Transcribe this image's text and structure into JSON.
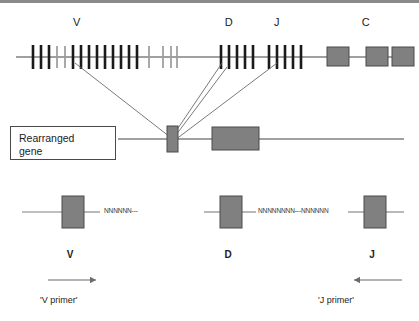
{
  "figure": {
    "colors": {
      "line": "#808080",
      "segment_dark": "#1a1a1a",
      "segment_light": "#9a9a9a",
      "box_fill": "#808080",
      "box_stroke": "#4a4a4a",
      "connector": "#6b6b6b",
      "text": "#222222",
      "top_rule": "#8a8a8a"
    }
  },
  "germline": {
    "labels": [
      {
        "text": "V",
        "x": 77,
        "y": 17
      },
      {
        "text": "D",
        "x": 229,
        "y": 17
      },
      {
        "text": "J",
        "x": 277,
        "y": 17
      },
      {
        "text": "C",
        "x": 366,
        "y": 17
      }
    ],
    "axis": {
      "x1": 16,
      "x2": 412,
      "y": 57
    },
    "v_cluster_dark": [
      33,
      41,
      49,
      73,
      81,
      89,
      97,
      105,
      113,
      121,
      129,
      137
    ],
    "v_cluster_light": [
      57,
      65,
      149,
      163,
      171,
      177
    ],
    "d_cluster": [
      221,
      229,
      237,
      245,
      253
    ],
    "j_cluster": [
      269,
      277,
      285,
      293,
      301
    ],
    "c_boxes": [
      {
        "x": 327,
        "y": 47,
        "w": 22,
        "h": 19
      },
      {
        "x": 366,
        "y": 47,
        "w": 22,
        "h": 19
      },
      {
        "x": 392,
        "y": 47,
        "w": 22,
        "h": 19
      }
    ]
  },
  "rearranged": {
    "caption": "Rearranged\ngene",
    "axis": {
      "x1": 118,
      "x2": 404,
      "y": 139
    },
    "v_segment_box": {
      "x": 167,
      "y": 126,
      "w": 11,
      "h": 26
    },
    "dj_segment_box": {
      "x": 212,
      "y": 127,
      "w": 47,
      "h": 23
    },
    "connectors": [
      {
        "x1": 75,
        "y1": 63,
        "x2": 170,
        "y2": 137
      },
      {
        "x1": 222,
        "y1": 63,
        "x2": 172,
        "y2": 137
      },
      {
        "x1": 227,
        "y1": 67,
        "x2": 173,
        "y2": 139
      },
      {
        "x1": 277,
        "y1": 63,
        "x2": 175,
        "y2": 140
      }
    ]
  },
  "primers": {
    "segments": [
      {
        "name": "V",
        "label": "V",
        "label_x": 70,
        "label_y": 250,
        "box": {
          "x": 62,
          "y": 196,
          "w": 22,
          "h": 32
        },
        "line_left": {
          "x1": 22,
          "x2": 62,
          "y": 212
        },
        "line_right": {
          "x1": 84,
          "x2": 100,
          "y": 212
        },
        "nnn": "NNNNNN---",
        "nnn_x": 104,
        "nnn_y": 208
      },
      {
        "name": "D",
        "label": "D",
        "label_x": 228,
        "label_y": 250,
        "box": {
          "x": 220,
          "y": 196,
          "w": 22,
          "h": 32
        },
        "line_left": {
          "x1": 204,
          "x2": 220,
          "y": 212
        },
        "line_right": {
          "x1": 242,
          "x2": 256,
          "y": 212
        },
        "nnn": "NNNNNNNN---NNNNNN",
        "nnn_x": 258,
        "nnn_y": 208
      },
      {
        "name": "J",
        "label": "J",
        "label_x": 372,
        "label_y": 250,
        "box": {
          "x": 364,
          "y": 196,
          "w": 22,
          "h": 32
        },
        "line_left": {
          "x1": 348,
          "x2": 364,
          "y": 212
        },
        "line_right": {
          "x1": 386,
          "x2": 404,
          "y": 212
        },
        "nnn": "",
        "nnn_x": 0,
        "nnn_y": 0
      }
    ],
    "v_primer": {
      "label": "'V primer'",
      "label_x": 40,
      "label_y": 296,
      "arrow": {
        "x1": 48,
        "x2": 96,
        "y": 280,
        "direction": "right"
      }
    },
    "j_primer": {
      "label": "'J primer'",
      "label_x": 318,
      "label_y": 296,
      "arrow": {
        "x1": 402,
        "x2": 354,
        "y": 280,
        "direction": "left"
      }
    }
  }
}
